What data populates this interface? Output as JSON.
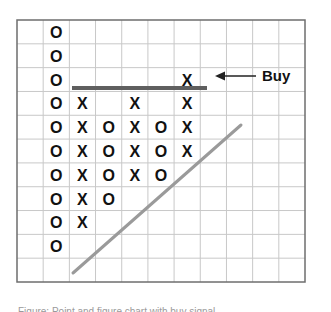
{
  "chart_data": {
    "type": "point-and-figure",
    "title": "",
    "grid": {
      "columns": 11,
      "rows": 11,
      "left": 17,
      "top": 20,
      "right": 305,
      "bottom": 282
    },
    "colors": {
      "grid": "#c8c8c8",
      "border": "#6e6e6e",
      "symbol": "#111111",
      "resistance": "#5f5f5f",
      "trendline": "#9a9a9a",
      "arrow": "#222222"
    },
    "columns": [
      {
        "col": 1,
        "symbol": "O",
        "rows": [
          0,
          1,
          2,
          3,
          4,
          5,
          6,
          7,
          8,
          9
        ]
      },
      {
        "col": 2,
        "symbol": "X",
        "rows": [
          3,
          4,
          5,
          6,
          7,
          8
        ]
      },
      {
        "col": 3,
        "symbol": "O",
        "rows": [
          4,
          5,
          6,
          7
        ]
      },
      {
        "col": 4,
        "symbol": "X",
        "rows": [
          3,
          4,
          5,
          6
        ]
      },
      {
        "col": 5,
        "symbol": "O",
        "rows": [
          4,
          5,
          6
        ]
      },
      {
        "col": 6,
        "symbol": "X",
        "rows": [
          2,
          3,
          4,
          5
        ]
      }
    ],
    "resistance_line": {
      "x1": 72,
      "y1": 88,
      "x2": 207,
      "y2": 88,
      "label": "Resistance"
    },
    "trend_line": {
      "x1": 73,
      "y1": 273,
      "x2": 241,
      "y2": 125,
      "label": "Bullish support line"
    },
    "annotation": {
      "text": "Buy",
      "arrow_from_x": 256,
      "arrow_to_x": 215,
      "y": 76
    }
  },
  "caption": "Figure: Point and figure chart with buy signal"
}
